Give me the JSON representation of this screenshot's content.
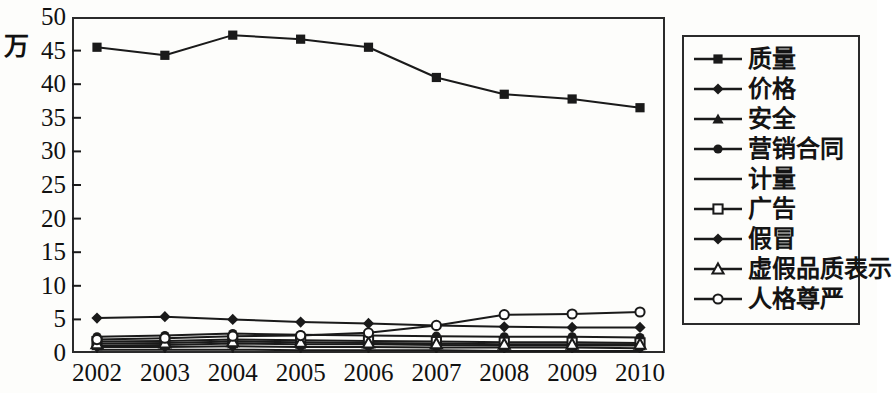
{
  "chart_data": {
    "type": "line",
    "title": "",
    "subtitle": "",
    "xlabel": "",
    "ylabel": "万",
    "unit_label": "万",
    "categories": [
      "2002",
      "2003",
      "2004",
      "2005",
      "2006",
      "2007",
      "2008",
      "2009",
      "2010"
    ],
    "x": [
      2002,
      2003,
      2004,
      2005,
      2006,
      2007,
      2008,
      2009,
      2010
    ],
    "ylim": [
      0,
      50
    ],
    "yticks": [
      0,
      5,
      10,
      15,
      20,
      25,
      30,
      35,
      40,
      45,
      50
    ],
    "ytick_labels": [
      "0",
      "5",
      "10",
      "15",
      "20",
      "25",
      "30",
      "35",
      "40",
      "45",
      "50"
    ],
    "grid": false,
    "legend_position": "right",
    "line_color": "#1a1a1a",
    "frame_color": "#2b2b2b",
    "series": [
      {
        "name": "质量",
        "marker": "filled-square",
        "values": [
          45.5,
          44.3,
          47.3,
          46.7,
          45.5,
          41.0,
          38.5,
          37.8,
          36.5
        ]
      },
      {
        "name": "价格",
        "marker": "filled-diamond",
        "values": [
          5.2,
          5.4,
          5.0,
          4.6,
          4.4,
          4.1,
          3.9,
          3.8,
          3.8
        ]
      },
      {
        "name": "安全",
        "marker": "filled-triangle",
        "values": [
          1.1,
          1.2,
          1.4,
          1.3,
          1.3,
          1.2,
          1.1,
          1.1,
          1.1
        ]
      },
      {
        "name": "营销合同",
        "marker": "filled-circle",
        "values": [
          2.4,
          2.6,
          2.9,
          2.7,
          2.6,
          2.5,
          2.4,
          2.4,
          2.3
        ]
      },
      {
        "name": "计量",
        "marker": "none",
        "values": [
          0.5,
          0.5,
          0.5,
          0.4,
          0.4,
          0.4,
          0.3,
          0.3,
          0.3
        ]
      },
      {
        "name": "广告",
        "marker": "open-square",
        "values": [
          1.7,
          1.8,
          2.0,
          1.9,
          1.8,
          1.7,
          1.6,
          1.6,
          1.5
        ]
      },
      {
        "name": "假冒",
        "marker": "filled-diamond",
        "values": [
          0.9,
          0.9,
          1.0,
          0.9,
          0.9,
          0.8,
          0.8,
          0.8,
          0.7
        ]
      },
      {
        "name": "虚假品质表示",
        "marker": "open-triangle",
        "values": [
          1.4,
          1.5,
          1.7,
          1.6,
          1.5,
          1.4,
          1.3,
          1.3,
          1.3
        ]
      },
      {
        "name": "人格尊严",
        "marker": "open-circle",
        "values": [
          2.0,
          2.2,
          2.5,
          2.6,
          3.0,
          4.1,
          5.7,
          5.8,
          6.1
        ]
      }
    ]
  },
  "legend": {
    "items": [
      {
        "label": "质量",
        "marker": "filled-square"
      },
      {
        "label": "价格",
        "marker": "filled-diamond"
      },
      {
        "label": "安全",
        "marker": "filled-triangle"
      },
      {
        "label": "营销合同",
        "marker": "filled-circle"
      },
      {
        "label": "计量",
        "marker": "none"
      },
      {
        "label": "广告",
        "marker": "open-square"
      },
      {
        "label": "假冒",
        "marker": "filled-diamond"
      },
      {
        "label": "虚假品质表示",
        "marker": "open-triangle"
      },
      {
        "label": "人格尊严",
        "marker": "open-circle"
      }
    ]
  }
}
